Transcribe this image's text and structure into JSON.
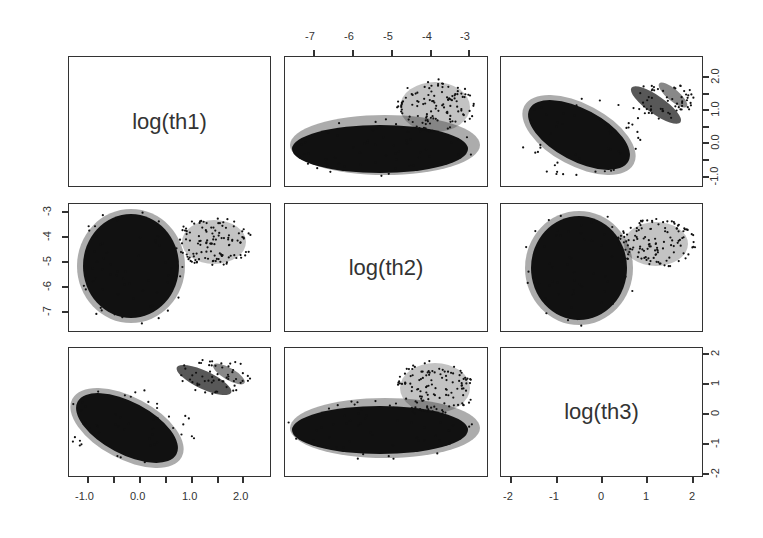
{
  "chart_data": {
    "type": "scatter",
    "title": "",
    "variables": [
      "log(th1)",
      "log(th2)",
      "log(th3)"
    ],
    "layout": "pairs matrix 3x3 (diagonal labels, off-diagonal scatterplots)",
    "axes": {
      "log(th1)": {
        "ticks": [
          -1.0,
          -0.5,
          0.0,
          0.5,
          1.0,
          1.5,
          2.0
        ],
        "tick_labels": [
          "-1.0",
          "0.0",
          "1.0",
          "2.0"
        ],
        "range": [
          -1.3,
          2.5
        ]
      },
      "log(th2)": {
        "ticks": [
          -7,
          -6,
          -5,
          -4,
          -3
        ],
        "tick_labels": [
          "-7",
          "-6",
          "-5",
          "-4",
          "-3"
        ],
        "range": [
          -7.7,
          -2.6
        ]
      },
      "log(th3)": {
        "ticks": [
          -2,
          -1,
          0,
          1,
          2
        ],
        "tick_labels": [
          "-2",
          "-1",
          "0",
          "1",
          "2"
        ],
        "range": [
          -2.1,
          2.1
        ]
      }
    },
    "axis_placement": {
      "top": "log(th2) ticks above column 2",
      "right_row1": "log(th1) ticks right of row 1",
      "left_row2": "log(th2) ticks left of row 2",
      "right_row3": "log(th3) ticks right of row 3",
      "bottom_col1": "log(th1) ticks below column 1",
      "bottom_col3": "log(th3) ticks below column 3"
    },
    "clusters": [
      {
        "name": "main mode",
        "log_th1_center": -0.2,
        "log_th2_center": -5.4,
        "log_th3_center": -0.3,
        "correlation_th1_th3": "strong negative",
        "density": "very high"
      },
      {
        "name": "secondary mode",
        "log_th1_center": 1.2,
        "log_th2_center": -4.0,
        "log_th3_center": 1.2,
        "correlation_th1_th3": "negative",
        "density": "sparse"
      }
    ],
    "panels": [
      {
        "row": 1,
        "col": 1,
        "kind": "label",
        "text": "log(th1)"
      },
      {
        "row": 1,
        "col": 2,
        "kind": "scatter",
        "x": "log(th2)",
        "y": "log(th1)"
      },
      {
        "row": 1,
        "col": 3,
        "kind": "scatter",
        "x": "log(th3)",
        "y": "log(th1)"
      },
      {
        "row": 2,
        "col": 1,
        "kind": "scatter",
        "x": "log(th1)",
        "y": "log(th2)"
      },
      {
        "row": 2,
        "col": 2,
        "kind": "label",
        "text": "log(th2)"
      },
      {
        "row": 2,
        "col": 3,
        "kind": "scatter",
        "x": "log(th3)",
        "y": "log(th2)"
      },
      {
        "row": 3,
        "col": 1,
        "kind": "scatter",
        "x": "log(th1)",
        "y": "log(th3)"
      },
      {
        "row": 3,
        "col": 2,
        "kind": "scatter",
        "x": "log(th2)",
        "y": "log(th3)"
      },
      {
        "row": 3,
        "col": 3,
        "kind": "label",
        "text": "log(th3)"
      }
    ],
    "grid": false,
    "legend": null
  },
  "labels": {
    "th1": "log(th1)",
    "th2": "log(th2)",
    "th3": "log(th3)"
  },
  "ticks": {
    "top_th2": [
      "-7",
      "-6",
      "-5",
      "-4",
      "-3"
    ],
    "right_th1": [
      "2.0",
      "1.0",
      "0.0",
      "-1.0"
    ],
    "left_th2": [
      "-3",
      "-4",
      "-5",
      "-6",
      "-7"
    ],
    "right_th3": [
      "2",
      "1",
      "0",
      "-1",
      "-2"
    ],
    "bottom_th1": [
      "-1.0",
      "0.0",
      "1.0",
      "2.0"
    ],
    "bottom_th3": [
      "-2",
      "-1",
      "0",
      "1",
      "2"
    ]
  },
  "colors": {
    "points": "#111111",
    "frame": "#333333",
    "background": "#ffffff"
  }
}
